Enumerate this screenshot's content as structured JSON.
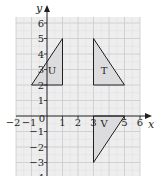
{
  "figure": {
    "type": "coordinate-grid-transformations",
    "axes": {
      "x_label": "x",
      "y_label": "y",
      "x_ticks": [
        "−2",
        "−1",
        "0",
        "1",
        "2",
        "3",
        "4",
        "5",
        "6"
      ],
      "y_ticks": [
        "6",
        "5",
        "4",
        "3",
        "2",
        "1",
        "−1",
        "−2",
        "−3",
        "−4"
      ],
      "x_range": [
        -2,
        6
      ],
      "y_range": [
        -4,
        6
      ]
    },
    "shapes": [
      {
        "label": "U",
        "vertices": [
          [
            -1,
            2
          ],
          [
            1,
            5
          ],
          [
            1,
            2
          ]
        ]
      },
      {
        "label": "T",
        "vertices": [
          [
            3,
            5
          ],
          [
            3,
            2
          ],
          [
            5,
            2
          ]
        ]
      },
      {
        "label": "V",
        "vertices": [
          [
            3,
            0
          ],
          [
            5,
            0
          ],
          [
            3,
            -3
          ]
        ]
      }
    ],
    "colors": {
      "grid_fill": "#eeeeef",
      "grid_line": "#c9c9cb",
      "shape_fill": "#dcdcde",
      "line": "#231f20"
    }
  }
}
